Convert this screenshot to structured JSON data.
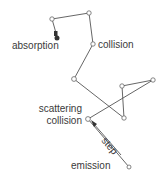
{
  "diagram": {
    "labels": {
      "absorption": "absorption",
      "collision": "collision",
      "scattering_line1": "scattering",
      "scattering_line2": "collision",
      "step": "step",
      "emission": "emission"
    },
    "colors": {
      "line": "#555555",
      "text": "#3a3a3a",
      "absorption_node": "#333333"
    },
    "path_order": [
      "emission",
      "scattering",
      "n_e",
      "n_f",
      "n_g",
      "n_d",
      "collision",
      "n_b",
      "n_a",
      "absorption"
    ],
    "nodes": {
      "emission": [
        129,
        167
      ],
      "scattering": [
        88,
        119
      ],
      "n_e": [
        153,
        80
      ],
      "n_f": [
        122,
        86
      ],
      "n_g": [
        124,
        118
      ],
      "n_d": [
        74,
        79
      ],
      "collision": [
        93,
        44
      ],
      "n_b": [
        89,
        13
      ],
      "n_a": [
        52,
        19
      ],
      "absorption": [
        57,
        37
      ]
    }
  }
}
